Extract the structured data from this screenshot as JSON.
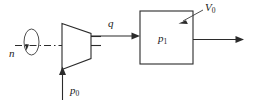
{
  "figure": {
    "background_color": "#ffffff",
    "line_color": "#2b2b2b"
  },
  "labels": {
    "shaft_speed": "n",
    "inlet_pressure_symbol": "p",
    "inlet_pressure_subscript": "0",
    "flow_rate": "q",
    "vessel_pressure_symbol": "p",
    "vessel_pressure_subscript": "1",
    "vessel_volume_symbol": "V",
    "vessel_volume_subscript": "0"
  },
  "components": {
    "compressor": {
      "name": "compressor",
      "shape": "trapezoid",
      "orientation": "narrowing-right"
    },
    "vessel": {
      "name": "pressure-vessel",
      "shape": "rectangle"
    },
    "shaft": {
      "name": "drive-shaft",
      "style": "dash-dot centerline"
    },
    "rotation_indicator": {
      "name": "rotation-arrow",
      "shape": "ellipse with arrowhead"
    }
  },
  "flows": [
    {
      "name": "inlet-flow",
      "direction": "upward",
      "label": "p0"
    },
    {
      "name": "delivery-flow",
      "direction": "rightward",
      "label": "q"
    },
    {
      "name": "outlet-flow",
      "direction": "rightward",
      "label": ""
    }
  ]
}
